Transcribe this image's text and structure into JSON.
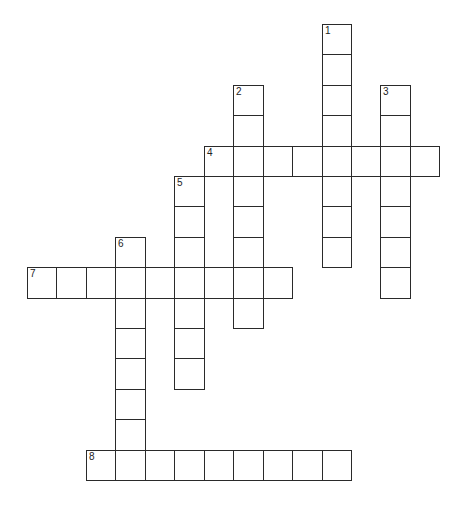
{
  "puzzle": {
    "type": "crossword",
    "cell_size": {
      "w": 29.45,
      "h": 30.4
    },
    "origin": {
      "x": 27,
      "y": 24
    },
    "entries": [
      {
        "number": "1",
        "direction": "down",
        "row": 0,
        "col": 10,
        "length": 8
      },
      {
        "number": "2",
        "direction": "down",
        "row": 2,
        "col": 7,
        "length": 8
      },
      {
        "number": "3",
        "direction": "down",
        "row": 2,
        "col": 12,
        "length": 7
      },
      {
        "number": "4",
        "direction": "across",
        "row": 4,
        "col": 6,
        "length": 8
      },
      {
        "number": "5",
        "direction": "down",
        "row": 5,
        "col": 5,
        "length": 7
      },
      {
        "number": "6",
        "direction": "down",
        "row": 7,
        "col": 3,
        "length": 8
      },
      {
        "number": "7",
        "direction": "across",
        "row": 8,
        "col": 0,
        "length": 9
      },
      {
        "number": "8",
        "direction": "across",
        "row": 14,
        "col": 2,
        "length": 9
      }
    ]
  },
  "colors": {
    "line": "#2a2a2a",
    "background": "#ffffff",
    "number": "#222222"
  }
}
